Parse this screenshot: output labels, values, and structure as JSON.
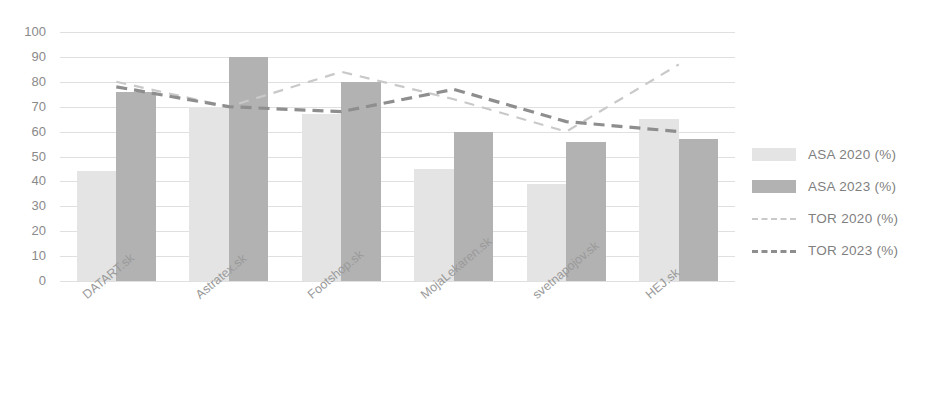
{
  "chart_data": {
    "type": "bar",
    "title": "",
    "subtitle": "",
    "xlabel": "",
    "ylabel": "",
    "ylim": [
      0,
      100
    ],
    "ytick_step": 10,
    "yticks": [
      "100",
      "90",
      "80",
      "70",
      "60",
      "50",
      "40",
      "30",
      "20",
      "10",
      "0"
    ],
    "grid": true,
    "legend_position": "right",
    "categories": [
      "DATART.sk",
      "Astratex.sk",
      "Footshop.sk",
      "MojaLekaren.sk",
      "svetnapojov.sk",
      "HEJ.sk"
    ],
    "series": [
      {
        "name": "ASA 2020 (%)",
        "type": "bar",
        "color": "#e4e4e4",
        "values": [
          44,
          70,
          67,
          45,
          39,
          65
        ]
      },
      {
        "name": "ASA 2023 (%)",
        "type": "bar",
        "color": "#b2b2b2",
        "values": [
          76,
          90,
          80,
          60,
          56,
          57
        ]
      },
      {
        "name": "TOR 2020 (%)",
        "type": "line",
        "style": "dashed",
        "color": "#c9c9c9",
        "values": [
          80,
          70,
          84,
          73,
          60,
          87
        ]
      },
      {
        "name": "TOR 2023 (%)",
        "type": "line",
        "style": "dashed",
        "color": "#8e8e8e",
        "values": [
          78,
          70,
          68,
          77,
          64,
          60
        ]
      }
    ]
  },
  "legend": {
    "items": [
      {
        "label": "ASA 2020 (%)",
        "kind": "swatch",
        "class": "sw-asa2020"
      },
      {
        "label": "ASA 2023 (%)",
        "kind": "swatch",
        "class": "sw-asa2023"
      },
      {
        "label": "TOR 2020 (%)",
        "kind": "dash",
        "class": "ds-tor2020"
      },
      {
        "label": "TOR 2023 (%)",
        "kind": "dash",
        "class": "ds-tor2023"
      }
    ]
  },
  "colors": {
    "asa_2020": "#e4e4e4",
    "asa_2023": "#b2b2b2",
    "tor_2020": "#c9c9c9",
    "tor_2023": "#8e8e8e",
    "gridline": "#e0e0e0",
    "tick_text": "#8a8a8a",
    "category_text": "#9a9a9a",
    "legend_text": "#7f7f7f"
  },
  "plot_geometry": {
    "left": 60,
    "right": 735,
    "top": 32,
    "bottom": 281
  }
}
